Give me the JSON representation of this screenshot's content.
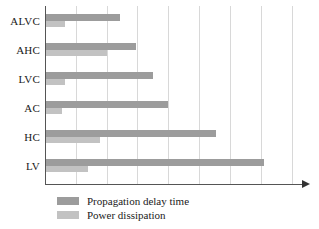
{
  "chart_data": {
    "type": "bar",
    "orientation": "horizontal",
    "title": "",
    "xlabel": "",
    "ylabel": "",
    "categories": [
      "ALVC",
      "AHC",
      "LVC",
      "AC",
      "HC",
      "LV"
    ],
    "series": [
      {
        "name": "Propagation delay time",
        "color": "#9c9c9c",
        "values": [
          2.45,
          2.95,
          3.5,
          4.0,
          5.55,
          7.1
        ]
      },
      {
        "name": "Power dissipation",
        "color": "#c2c2c2",
        "values": [
          0.65,
          2.0,
          0.65,
          0.55,
          1.8,
          1.4
        ]
      }
    ],
    "xlim": [
      0,
      8.6
    ],
    "gridlines": [
      1,
      2,
      3,
      4,
      5,
      6,
      7,
      8
    ],
    "grid": true,
    "grid_axis": "x",
    "axis_arrow": true,
    "tick_labels": [],
    "legend_position": "bottom-left"
  },
  "legend": {
    "items": [
      {
        "label": "Propagation delay time",
        "swatch": "delay"
      },
      {
        "label": "Power dissipation",
        "swatch": "power"
      }
    ]
  },
  "colors": {
    "delay": "#9c9c9c",
    "power": "#c2c2c2",
    "grid": "#d8d8d8",
    "axis": "#555555",
    "text": "#1a1a1a",
    "background": "#ffffff"
  }
}
